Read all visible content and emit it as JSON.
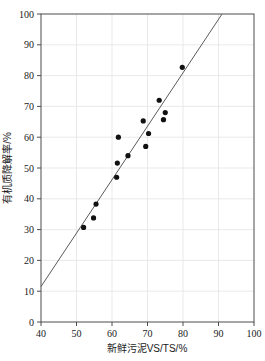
{
  "chart_data": {
    "type": "scatter",
    "title": "",
    "xlabel": "新鲜污泥VS/TS/%",
    "ylabel": "有机质降解率/%",
    "xlim": [
      40,
      100
    ],
    "ylim": [
      0,
      100
    ],
    "xticks": [
      40,
      50,
      60,
      70,
      80,
      90,
      100
    ],
    "yticks": [
      0,
      10,
      20,
      30,
      40,
      50,
      60,
      70,
      80,
      90,
      100
    ],
    "grid": true,
    "legend": "none",
    "marker_color": "#111111",
    "line_color": "#5a5a5a",
    "grid_color": "#e3e3e3",
    "axis_color": "#4d4d4d",
    "points": [
      {
        "x": 52.0,
        "y": 30.7
      },
      {
        "x": 54.8,
        "y": 33.8
      },
      {
        "x": 55.5,
        "y": 38.3
      },
      {
        "x": 61.3,
        "y": 47.0
      },
      {
        "x": 61.5,
        "y": 51.6
      },
      {
        "x": 61.8,
        "y": 60.0
      },
      {
        "x": 64.5,
        "y": 54.0
      },
      {
        "x": 68.8,
        "y": 65.3
      },
      {
        "x": 69.5,
        "y": 57.0
      },
      {
        "x": 70.3,
        "y": 61.2
      },
      {
        "x": 73.3,
        "y": 72.0
      },
      {
        "x": 74.5,
        "y": 65.7
      },
      {
        "x": 75.0,
        "y": 68.0
      },
      {
        "x": 79.8,
        "y": 82.7
      }
    ],
    "trend_line": {
      "x_start": 40.0,
      "y_start": 11.5,
      "x_end": 91.0,
      "y_end": 100.0
    }
  }
}
